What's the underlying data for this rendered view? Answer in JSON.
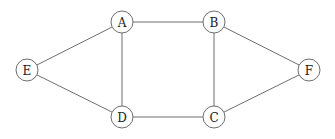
{
  "graph": {
    "node_radius": 11,
    "colors": {
      "stroke": "#6e6e6e",
      "label": "#222222",
      "background": "#ffffff"
    },
    "nodes": [
      {
        "id": "A",
        "label": "A",
        "x": 122,
        "y": 22
      },
      {
        "id": "B",
        "label": "B",
        "x": 214,
        "y": 22
      },
      {
        "id": "C",
        "label": "C",
        "x": 214,
        "y": 117
      },
      {
        "id": "D",
        "label": "D",
        "x": 122,
        "y": 117
      },
      {
        "id": "E",
        "label": "E",
        "x": 27,
        "y": 70
      },
      {
        "id": "F",
        "label": "F",
        "x": 309,
        "y": 70
      }
    ],
    "edges": [
      {
        "from": "A",
        "to": "B"
      },
      {
        "from": "A",
        "to": "E"
      },
      {
        "from": "A",
        "to": "D"
      },
      {
        "from": "E",
        "to": "D"
      },
      {
        "from": "D",
        "to": "C"
      },
      {
        "from": "B",
        "to": "C"
      },
      {
        "from": "B",
        "to": "F"
      },
      {
        "from": "C",
        "to": "F"
      }
    ]
  }
}
